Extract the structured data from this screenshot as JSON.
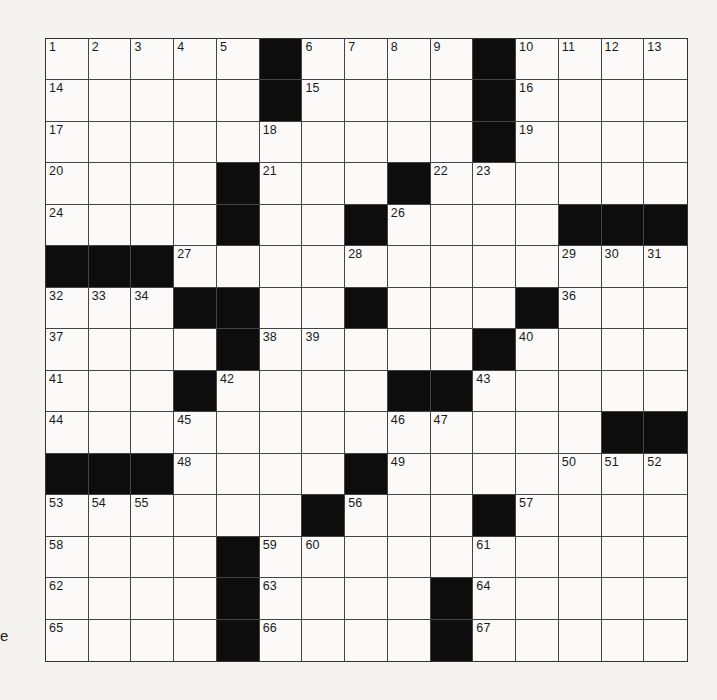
{
  "puzzle": {
    "rows": 15,
    "cols": 15,
    "colors": {
      "block": "#0d0d0d",
      "cell": "#fbfaf8",
      "line": "#444444",
      "paper": "#f4f3f0"
    },
    "layout": [
      ".....#....#....",
      ".....#....#....",
      "..........#....",
      "....#...#......",
      "....#..#....###",
      "###............",
      "...##..#...#...",
      "....#.....#....",
      "...#....##.....",
      ".............##",
      "###....#.......",
      "......#...#....",
      "....#..........",
      "....#....#.....",
      "....#....#....."
    ],
    "numbers": [
      [
        1,
        2,
        3,
        4,
        5,
        0,
        6,
        7,
        8,
        9,
        0,
        10,
        11,
        12,
        13
      ],
      [
        14,
        0,
        0,
        0,
        0,
        0,
        15,
        0,
        0,
        0,
        0,
        16,
        0,
        0,
        0
      ],
      [
        17,
        0,
        0,
        0,
        0,
        18,
        0,
        0,
        0,
        0,
        0,
        19,
        0,
        0,
        0
      ],
      [
        20,
        0,
        0,
        0,
        0,
        21,
        0,
        0,
        0,
        22,
        23,
        0,
        0,
        0,
        0
      ],
      [
        24,
        0,
        0,
        0,
        25,
        0,
        0,
        0,
        26,
        0,
        0,
        0,
        0,
        0,
        0
      ],
      [
        0,
        0,
        0,
        27,
        0,
        0,
        0,
        28,
        0,
        0,
        0,
        0,
        29,
        30,
        31
      ],
      [
        32,
        33,
        34,
        0,
        0,
        0,
        0,
        35,
        0,
        0,
        0,
        0,
        36,
        0,
        0
      ],
      [
        37,
        0,
        0,
        0,
        0,
        38,
        39,
        0,
        0,
        0,
        0,
        40,
        0,
        0,
        0
      ],
      [
        41,
        0,
        0,
        0,
        42,
        0,
        0,
        0,
        0,
        0,
        43,
        0,
        0,
        0,
        0
      ],
      [
        44,
        0,
        0,
        45,
        0,
        0,
        0,
        0,
        46,
        47,
        0,
        0,
        0,
        0,
        0
      ],
      [
        0,
        0,
        0,
        48,
        0,
        0,
        0,
        0,
        49,
        0,
        0,
        0,
        50,
        51,
        52
      ],
      [
        53,
        54,
        55,
        0,
        0,
        0,
        0,
        56,
        0,
        0,
        0,
        57,
        0,
        0,
        0
      ],
      [
        58,
        0,
        0,
        0,
        0,
        59,
        60,
        0,
        0,
        0,
        61,
        0,
        0,
        0,
        0
      ],
      [
        62,
        0,
        0,
        0,
        0,
        63,
        0,
        0,
        0,
        0,
        64,
        0,
        0,
        0,
        0
      ],
      [
        65,
        0,
        0,
        0,
        0,
        66,
        0,
        0,
        0,
        0,
        67,
        0,
        0,
        0,
        0
      ]
    ],
    "entries": []
  },
  "margin_text": "e"
}
